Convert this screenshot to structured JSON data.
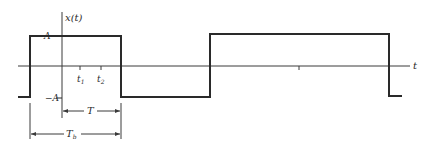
{
  "figure": {
    "type": "square-wave-signal",
    "signal_label": "x(t)",
    "time_axis_label": "t",
    "amplitude_high_label": "A",
    "amplitude_low_label": "−A",
    "tick_labels": [
      "t₁",
      "t₂"
    ],
    "tick_label_main": [
      "t",
      "t"
    ],
    "tick_label_subs": [
      "1",
      "2"
    ],
    "dimension_T_label": "T",
    "dimension_Tb_label": "T",
    "dimension_Tb_sub": "b",
    "colors": {
      "line": "#2a2a2a",
      "axis": "#3a3a3a",
      "background": "#ffffff"
    }
  }
}
